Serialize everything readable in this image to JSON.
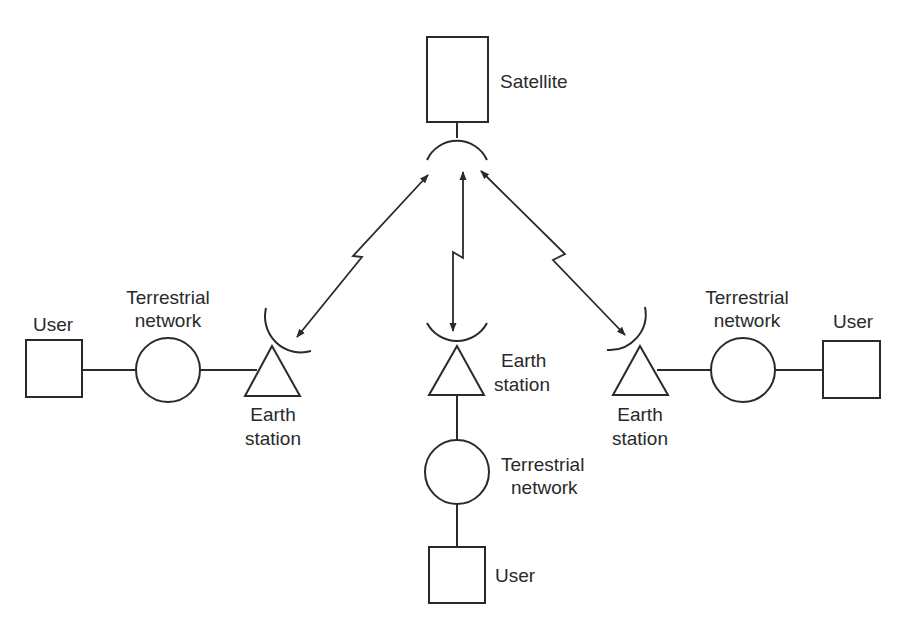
{
  "diagram": {
    "type": "satellite-communication-network",
    "colors": {
      "ink": "#2a2a2a",
      "background": "#ffffff"
    },
    "satellite": {
      "label": "Satellite"
    },
    "left_branch": {
      "user_label": "User",
      "network_label_line1": "Terrestrial",
      "network_label_line2": "network",
      "earth_station_line1": "Earth",
      "earth_station_line2": "station"
    },
    "center_branch": {
      "earth_station_line1": "Earth",
      "earth_station_line2": "station",
      "network_label_line1": "Terrestrial",
      "network_label_line2": "network",
      "user_label": "User"
    },
    "right_branch": {
      "earth_station_line1": "Earth",
      "earth_station_line2": "station",
      "network_label_line1": "Terrestrial",
      "network_label_line2": "network",
      "user_label": "User"
    },
    "links": [
      {
        "from": "satellite",
        "to": "left-earth-station",
        "type": "bidirectional-radio-link"
      },
      {
        "from": "satellite",
        "to": "center-earth-station",
        "type": "bidirectional-radio-link"
      },
      {
        "from": "satellite",
        "to": "right-earth-station",
        "type": "bidirectional-radio-link"
      }
    ]
  }
}
